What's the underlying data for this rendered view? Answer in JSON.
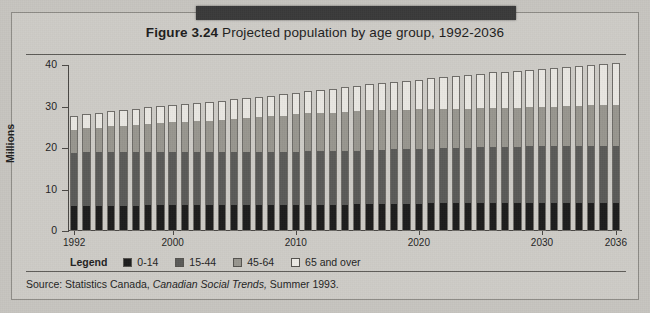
{
  "figure": {
    "number_label": "Figure 3.24",
    "title": "Projected population by age group, 1992-2036",
    "redaction_band": "black-band",
    "source_prefix": "Source:",
    "source_agency": "Statistics Canada,",
    "source_publication": "Canadian Social Trends,",
    "source_issue": "Summer 1993."
  },
  "legend": {
    "label": "Legend",
    "entries": [
      {
        "label": "0-14",
        "color": "#1c1c1c"
      },
      {
        "label": "15-44",
        "color": "#5a5a58"
      },
      {
        "label": "45-64",
        "color": "#98968f"
      },
      {
        "label": "65 and over",
        "color": "#eceae5"
      }
    ]
  },
  "chart_data": {
    "type": "bar",
    "stacked": true,
    "title": "Figure 3.24 Projected population by age group, 1992-2036",
    "xlabel": "",
    "ylabel": "Millions",
    "ylim": [
      0,
      40
    ],
    "yticks": [
      0,
      10,
      20,
      30,
      40
    ],
    "ytick_labels": [
      "0",
      "10",
      "20",
      "30",
      "40"
    ],
    "xtick_labels": [
      "1992",
      "2000",
      "2010",
      "2020",
      "2030",
      "2036"
    ],
    "xtick_years": [
      1992,
      2000,
      2010,
      2020,
      2030,
      2036
    ],
    "grid": false,
    "legend_position": "below-axis-left",
    "units": "Millions",
    "categories": [
      1992,
      1993,
      1994,
      1995,
      1996,
      1997,
      1998,
      1999,
      2000,
      2001,
      2002,
      2003,
      2004,
      2005,
      2006,
      2007,
      2008,
      2009,
      2010,
      2011,
      2012,
      2013,
      2014,
      2015,
      2016,
      2017,
      2018,
      2019,
      2020,
      2021,
      2022,
      2023,
      2024,
      2025,
      2026,
      2027,
      2028,
      2029,
      2030,
      2031,
      2032,
      2033,
      2034,
      2035,
      2036
    ],
    "series": [
      {
        "name": "0-14",
        "color": "#1c1c1c",
        "values": [
          5.8,
          5.9,
          5.9,
          6.0,
          6.0,
          6.0,
          6.1,
          6.1,
          6.1,
          6.1,
          6.1,
          6.1,
          6.1,
          6.1,
          6.1,
          6.1,
          6.1,
          6.1,
          6.2,
          6.2,
          6.2,
          6.2,
          6.2,
          6.3,
          6.3,
          6.3,
          6.4,
          6.4,
          6.4,
          6.5,
          6.5,
          6.5,
          6.5,
          6.6,
          6.6,
          6.6,
          6.6,
          6.6,
          6.6,
          6.6,
          6.6,
          6.6,
          6.6,
          6.6,
          6.6
        ]
      },
      {
        "name": "15-44",
        "color": "#5a5a58",
        "values": [
          13.2,
          13.2,
          13.2,
          13.2,
          13.2,
          13.2,
          13.1,
          13.1,
          13.1,
          13.0,
          13.0,
          12.9,
          12.9,
          12.9,
          12.9,
          12.9,
          12.9,
          12.9,
          12.9,
          13.0,
          13.0,
          13.0,
          13.1,
          13.1,
          13.2,
          13.2,
          13.3,
          13.3,
          13.4,
          13.4,
          13.5,
          13.5,
          13.6,
          13.6,
          13.7,
          13.7,
          13.7,
          13.8,
          13.8,
          13.8,
          13.8,
          13.8,
          13.8,
          13.8,
          13.8
        ]
      },
      {
        "name": "45-64",
        "color": "#98968f",
        "values": [
          5.6,
          5.8,
          6.0,
          6.2,
          6.4,
          6.6,
          6.8,
          7.0,
          7.2,
          7.4,
          7.6,
          7.8,
          8.0,
          8.2,
          8.4,
          8.6,
          8.8,
          9.0,
          9.2,
          9.3,
          9.4,
          9.5,
          9.6,
          9.6,
          9.7,
          9.7,
          9.7,
          9.7,
          9.7,
          9.6,
          9.6,
          9.6,
          9.5,
          9.5,
          9.5,
          9.5,
          9.5,
          9.6,
          9.6,
          9.7,
          9.8,
          9.9,
          10.0,
          10.1,
          10.2
        ]
      },
      {
        "name": "65 and over",
        "color": "#eceae5",
        "values": [
          3.2,
          3.3,
          3.4,
          3.5,
          3.6,
          3.7,
          3.8,
          3.9,
          4.0,
          4.1,
          4.2,
          4.3,
          4.4,
          4.5,
          4.6,
          4.7,
          4.8,
          4.9,
          5.0,
          5.2,
          5.4,
          5.6,
          5.8,
          6.0,
          6.2,
          6.4,
          6.6,
          6.8,
          7.0,
          7.3,
          7.5,
          7.8,
          8.0,
          8.2,
          8.4,
          8.6,
          8.8,
          8.9,
          9.1,
          9.2,
          9.4,
          9.5,
          9.6,
          9.7,
          9.8
        ]
      }
    ],
    "totals": [
      27.8,
      28.2,
      28.5,
      28.9,
      29.2,
      29.5,
      29.8,
      30.1,
      30.4,
      30.6,
      30.9,
      31.1,
      31.4,
      31.7,
      32.0,
      32.3,
      32.6,
      32.9,
      33.3,
      33.7,
      34.0,
      34.3,
      34.7,
      35.0,
      35.4,
      35.6,
      36.0,
      36.2,
      36.5,
      36.8,
      37.1,
      37.4,
      37.6,
      37.9,
      38.2,
      38.4,
      38.6,
      38.9,
      39.1,
      39.3,
      39.6,
      39.8,
      40.0,
      40.2,
      40.4
    ]
  }
}
